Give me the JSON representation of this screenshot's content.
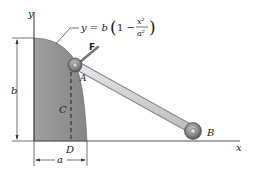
{
  "figure": {
    "equation": {
      "lhs": "y = b",
      "paren_open": "(",
      "one_minus": "1 −",
      "num": "x²",
      "den": "a²",
      "paren_close": ")"
    },
    "labels": {
      "y_axis": "y",
      "x_axis": "x",
      "height": "b",
      "width": "a",
      "force": "F",
      "point_a": "A",
      "point_b": "B",
      "point_c": "C",
      "point_d": "D"
    },
    "colors": {
      "region_fill": "#8f8f8f",
      "bar_fill": "#d4d4d4",
      "axis": "#333333"
    }
  }
}
